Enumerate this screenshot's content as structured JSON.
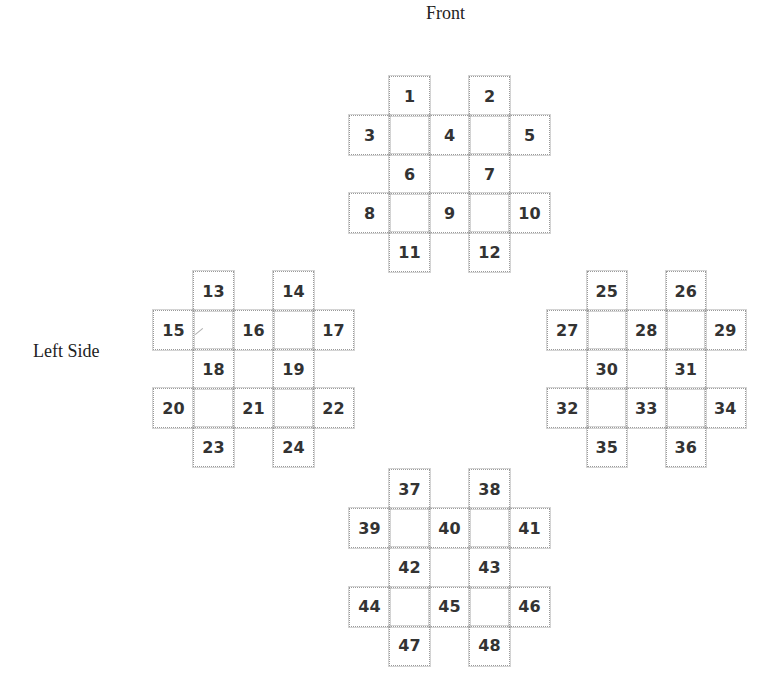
{
  "labels": {
    "front": "Front",
    "left_side": "Left Side"
  },
  "clusters": {
    "front": {
      "name": "Front",
      "cells": {
        "r0c1": "1",
        "r0c3": "2",
        "r1c0": "3",
        "r1c2": "4",
        "r1c4": "5",
        "r2c1": "6",
        "r2c3": "7",
        "r3c0": "8",
        "r3c2": "9",
        "r3c4": "10",
        "r4c1": "11",
        "r4c3": "12"
      }
    },
    "left": {
      "name": "Left Side",
      "cells": {
        "r0c1": "13",
        "r0c3": "14",
        "r1c0": "15",
        "r1c2": "16",
        "r1c4": "17",
        "r2c1": "18",
        "r2c3": "19",
        "r3c0": "20",
        "r3c2": "21",
        "r3c4": "22",
        "r4c1": "23",
        "r4c3": "24"
      }
    },
    "right": {
      "name": "Right Side",
      "cells": {
        "r0c1": "25",
        "r0c3": "26",
        "r1c0": "27",
        "r1c2": "28",
        "r1c4": "29",
        "r2c1": "30",
        "r2c3": "31",
        "r3c0": "32",
        "r3c2": "33",
        "r3c4": "34",
        "r4c1": "35",
        "r4c3": "36"
      }
    },
    "back": {
      "name": "Back",
      "cells": {
        "r0c1": "37",
        "r0c3": "38",
        "r1c0": "39",
        "r1c2": "40",
        "r1c4": "41",
        "r2c1": "42",
        "r2c3": "43",
        "r3c0": "44",
        "r3c2": "45",
        "r3c4": "46",
        "r4c1": "47",
        "r4c3": "48"
      }
    }
  }
}
